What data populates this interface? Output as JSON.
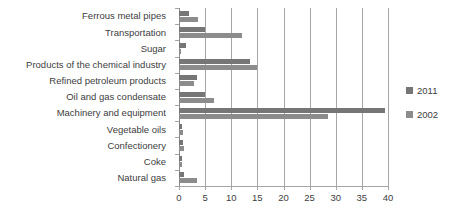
{
  "chart_data": {
    "type": "bar",
    "orientation": "horizontal",
    "title": "",
    "xlabel": "",
    "ylabel": "",
    "xlim": [
      0,
      40
    ],
    "xticks": [
      0,
      5,
      10,
      15,
      20,
      25,
      30,
      35,
      40
    ],
    "grid": true,
    "legend_position": "right",
    "categories": [
      "Ferrous metal pipes",
      "Transportation",
      "Sugar",
      "Products of the chemical industry",
      "Refined petroleum products",
      "Oil and gas condensate",
      "Machinery and equipment",
      "Vegetable oils",
      "Confectionery",
      "Coke",
      "Natural gas"
    ],
    "series": [
      {
        "name": "2011",
        "color": "#767676",
        "values": [
          2.0,
          5.0,
          1.3,
          13.5,
          3.5,
          5.0,
          39.5,
          0.5,
          0.7,
          0.5,
          1.0
        ]
      },
      {
        "name": "2002",
        "color": "#8c8c8c",
        "values": [
          3.7,
          12.0,
          0.3,
          15.0,
          2.8,
          6.7,
          28.5,
          0.8,
          1.0,
          0.6,
          3.5
        ]
      }
    ]
  },
  "legend": {
    "items": [
      {
        "label": "2011",
        "series": "series-2011"
      },
      {
        "label": "2002",
        "series": "series-2002"
      }
    ]
  }
}
